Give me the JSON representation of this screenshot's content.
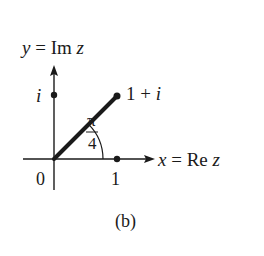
{
  "figure": {
    "caption": "(b)",
    "axes": {
      "y_label_var": "y",
      "y_label_rest": " = Im ",
      "y_label_z": "z",
      "x_label_var": "x",
      "x_label_rest": " = Re ",
      "x_label_z": "z"
    },
    "points": {
      "origin_label": "0",
      "real_unit_label": "1",
      "imag_unit_label": "i",
      "complex_point_label_prefix": "1 + ",
      "complex_point_label_i": "i"
    },
    "angle": {
      "numerator": "π",
      "denominator": "4"
    },
    "colors": {
      "ink": "#1a1a1a",
      "background": "#ffffff"
    }
  }
}
